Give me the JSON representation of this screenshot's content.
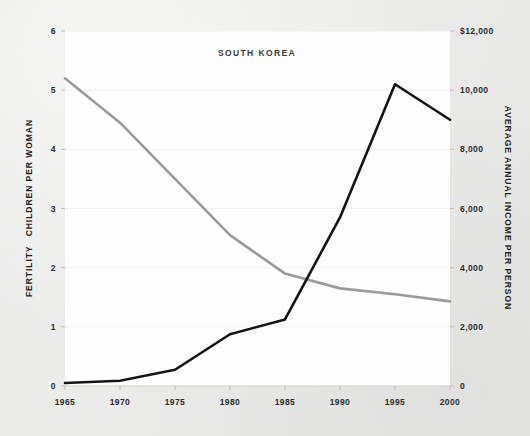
{
  "chart_data": {
    "type": "line",
    "title": "SOUTH KOREA",
    "xlabel": "",
    "categories": [
      1965,
      1970,
      1975,
      1980,
      1985,
      1990,
      1995,
      2000
    ],
    "x_tick_labels": [
      "1965",
      "1970",
      "1975",
      "1980",
      "1985",
      "1990",
      "1995",
      "2000"
    ],
    "xlim": [
      1965,
      2000
    ],
    "grid": true,
    "grid_axis": "y",
    "legend": "none",
    "axes": {
      "left": {
        "label": "FERTILITY  CHILDREN PER WOMAN",
        "label_emphasis": "FERTILITY",
        "label_rest": "CHILDREN PER WOMAN",
        "ylim": [
          0,
          6
        ],
        "ticks": [
          0,
          1,
          2,
          3,
          4,
          5,
          6
        ],
        "tick_labels": [
          "0",
          "1",
          "2",
          "3",
          "4",
          "5",
          "6"
        ],
        "color": "#9a9a9a"
      },
      "right": {
        "label": "AVERAGE ANNUAL INCOME  PER PERSON",
        "ylim": [
          0,
          12000
        ],
        "ticks": [
          0,
          2000,
          4000,
          6000,
          8000,
          10000,
          12000
        ],
        "tick_labels": [
          "0",
          "2,000",
          "4,000",
          "6,000",
          "8,000",
          "10,000",
          "$12,000"
        ],
        "color": "#141414"
      }
    },
    "series": [
      {
        "name": "Average annual income per person",
        "axis": "right",
        "color": "#141414",
        "unit": "USD",
        "values": [
          100,
          180,
          550,
          1750,
          2250,
          5700,
          10200,
          9000
        ]
      },
      {
        "name": "Fertility, children per woman",
        "axis": "left",
        "color": "#9a9a9a",
        "unit": "children",
        "values": [
          5.2,
          4.45,
          3.5,
          2.55,
          1.9,
          1.65,
          1.55,
          1.43
        ]
      }
    ],
    "annotations": []
  },
  "colors": {
    "background": "#ececea",
    "plot_background": "#fdfdfd",
    "gridline": "#f0f0f0",
    "income_line": "#141414",
    "fertility_line": "#9a9a9a",
    "text": "#2c2c2c"
  }
}
